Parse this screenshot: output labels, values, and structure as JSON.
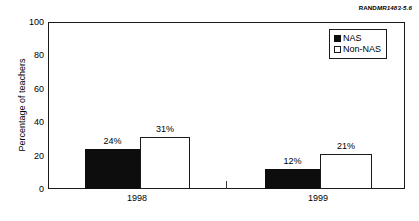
{
  "source_tag": {
    "brand": "RAND",
    "code": "MR1483-5.6"
  },
  "chart_data": {
    "type": "bar",
    "title": "",
    "subtitle": "",
    "xlabel": "",
    "ylabel": "Percentage of teachers",
    "ylim": [
      0,
      100
    ],
    "yticks": [
      0,
      20,
      40,
      60,
      80,
      100
    ],
    "ytick_labels": [
      "0",
      "20",
      "40",
      "60",
      "80",
      "100"
    ],
    "grid": false,
    "legend_position": "top-right",
    "categories": [
      "1998",
      "1999"
    ],
    "series": [
      {
        "name": "NAS",
        "color": "#0d0d0d",
        "values": [
          24,
          12
        ],
        "value_labels": [
          "24%",
          "12%"
        ]
      },
      {
        "name": "Non-NAS",
        "color": "#ffffff",
        "values": [
          31,
          21
        ],
        "value_labels": [
          "31%",
          "21%"
        ]
      }
    ],
    "legend": [
      {
        "label": "NAS",
        "swatch": "filled"
      },
      {
        "label": "Non-NAS",
        "swatch": "hollow"
      }
    ]
  }
}
